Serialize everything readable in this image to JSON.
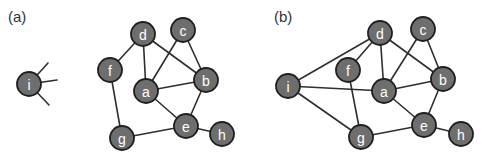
{
  "panels": [
    {
      "id": "a",
      "label": "(a)",
      "label_pos": [
        8,
        22
      ],
      "nodes": [
        {
          "id": "i",
          "x": 29,
          "y": 84
        },
        {
          "id": "d",
          "x": 143,
          "y": 34
        },
        {
          "id": "c",
          "x": 183,
          "y": 30
        },
        {
          "id": "f",
          "x": 110,
          "y": 70
        },
        {
          "id": "b",
          "x": 206,
          "y": 80
        },
        {
          "id": "a",
          "x": 146,
          "y": 91
        },
        {
          "id": "e",
          "x": 186,
          "y": 126
        },
        {
          "id": "h",
          "x": 222,
          "y": 134
        },
        {
          "id": "g",
          "x": 122,
          "y": 138
        }
      ],
      "edges": [
        [
          "d",
          "f"
        ],
        [
          "d",
          "a"
        ],
        [
          "d",
          "b"
        ],
        [
          "c",
          "a"
        ],
        [
          "c",
          "b"
        ],
        [
          "a",
          "b"
        ],
        [
          "a",
          "e"
        ],
        [
          "b",
          "e"
        ],
        [
          "e",
          "h"
        ],
        [
          "e",
          "g"
        ],
        [
          "f",
          "g"
        ]
      ],
      "stubs": [
        {
          "from": "i",
          "to": [
            48,
            63
          ]
        },
        {
          "from": "i",
          "to": [
            57,
            80
          ]
        },
        {
          "from": "i",
          "to": [
            49,
            105
          ]
        }
      ]
    },
    {
      "id": "b",
      "label": "(b)",
      "label_pos": [
        274,
        22
      ],
      "nodes": [
        {
          "id": "i",
          "x": 288,
          "y": 86
        },
        {
          "id": "d",
          "x": 380,
          "y": 33
        },
        {
          "id": "c",
          "x": 423,
          "y": 29
        },
        {
          "id": "f",
          "x": 348,
          "y": 70
        },
        {
          "id": "b",
          "x": 443,
          "y": 79
        },
        {
          "id": "a",
          "x": 384,
          "y": 91
        },
        {
          "id": "e",
          "x": 424,
          "y": 125
        },
        {
          "id": "h",
          "x": 461,
          "y": 134
        },
        {
          "id": "g",
          "x": 361,
          "y": 137
        }
      ],
      "edges": [
        [
          "i",
          "d"
        ],
        [
          "i",
          "a"
        ],
        [
          "i",
          "g"
        ],
        [
          "d",
          "f"
        ],
        [
          "d",
          "a"
        ],
        [
          "d",
          "b"
        ],
        [
          "c",
          "a"
        ],
        [
          "c",
          "b"
        ],
        [
          "a",
          "b"
        ],
        [
          "a",
          "e"
        ],
        [
          "b",
          "e"
        ],
        [
          "e",
          "h"
        ],
        [
          "e",
          "g"
        ],
        [
          "f",
          "g"
        ]
      ],
      "stubs": []
    }
  ],
  "style": {
    "node_radius": 12,
    "node_fill": "#6e6e6e",
    "node_stroke": "#1f1f1f",
    "edge_color": "#2e2e2e",
    "label_color": "#ffffff"
  }
}
